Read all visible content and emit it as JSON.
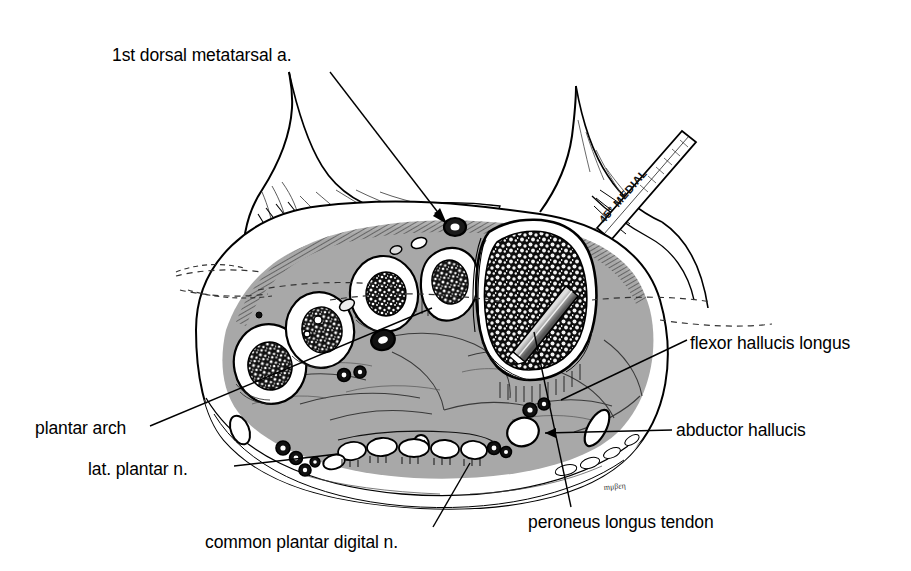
{
  "figure": {
    "kind": "anatomical-cross-section",
    "background_color": "#ffffff",
    "ink_color": "#000000",
    "muscle_fill_color": "#a8a8a8",
    "bone_cortex_color": "#ffffff",
    "marrow_color": "#1a1a1a",
    "instrument_text": "45° MEDIAL",
    "artist_signature": "initials"
  },
  "labels": [
    {
      "id": "dorsal",
      "text": "1st dorsal metatarsal a.",
      "x": 112,
      "y": 45,
      "align": "left"
    },
    {
      "id": "flexor",
      "text": "flexor hallucis longus",
      "x": 690,
      "y": 333,
      "align": "left"
    },
    {
      "id": "abductor",
      "text": "abductor hallucis",
      "x": 676,
      "y": 420,
      "align": "left"
    },
    {
      "id": "plantar_arch",
      "text": "plantar arch",
      "x": 35,
      "y": 418,
      "align": "left"
    },
    {
      "id": "lat_plantar",
      "text": "lat. plantar n.",
      "x": 88,
      "y": 459,
      "align": "left"
    },
    {
      "id": "common",
      "text": "common plantar digital n.",
      "x": 205,
      "y": 532,
      "align": "left"
    },
    {
      "id": "peroneus",
      "text": "peroneus longus tendon",
      "x": 528,
      "y": 512,
      "align": "left"
    }
  ],
  "leader_lines": [
    {
      "id": "dorsal-leader",
      "from": [
        330,
        72
      ],
      "to": [
        447,
        224
      ],
      "arrow": true
    },
    {
      "id": "flexor-leader",
      "from": [
        687,
        340
      ],
      "to": [
        563,
        398
      ],
      "arrow": false
    },
    {
      "id": "abductor-leader",
      "from": [
        672,
        430
      ],
      "to": [
        543,
        432
      ],
      "arrow": true
    },
    {
      "id": "plantar-arch-leader",
      "from": [
        150,
        426
      ],
      "to": [
        430,
        310
      ],
      "arrow": false
    },
    {
      "id": "lat-plantar-leader",
      "from": [
        232,
        466
      ],
      "to": [
        330,
        455
      ],
      "arrow": false
    },
    {
      "id": "common-leader",
      "from": [
        432,
        528
      ],
      "to": [
        470,
        466
      ],
      "arrow": false
    },
    {
      "id": "peroneus-leader",
      "from": [
        570,
        508
      ],
      "to": [
        533,
        330
      ],
      "arrow": false
    }
  ],
  "structures": [
    {
      "name": "2nd metatarsal",
      "type": "bone"
    },
    {
      "name": "3rd metatarsal",
      "type": "bone"
    },
    {
      "name": "4th metatarsal",
      "type": "bone"
    },
    {
      "name": "5th metatarsal",
      "type": "bone"
    },
    {
      "name": "1st metatarsal",
      "type": "bone"
    },
    {
      "name": "interosseous muscles",
      "type": "muscle"
    },
    {
      "name": "flexor tendons",
      "type": "tendon"
    },
    {
      "name": "neurovascular bundles",
      "type": "vessel"
    },
    {
      "name": "surgical blade",
      "type": "instrument"
    },
    {
      "name": "hallux skin flap",
      "type": "soft-tissue"
    }
  ]
}
